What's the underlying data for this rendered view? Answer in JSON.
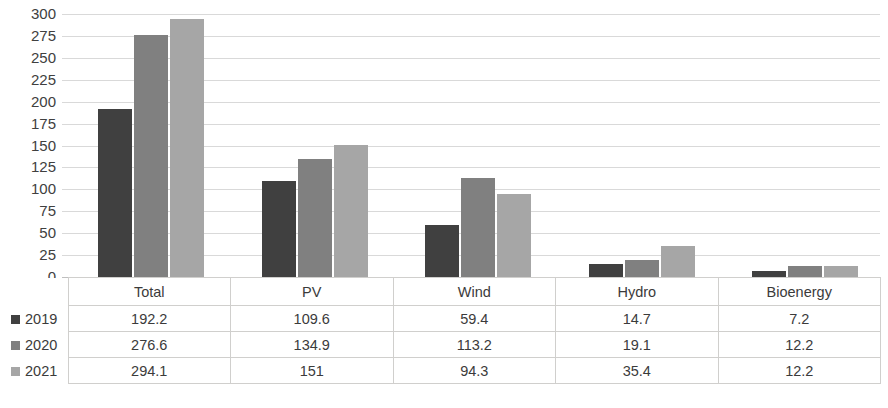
{
  "chart_data": {
    "type": "bar",
    "title": "",
    "xlabel": "",
    "ylabel": "",
    "ylim": [
      0,
      300
    ],
    "ytick_step": 25,
    "yticks": [
      300,
      275,
      250,
      225,
      200,
      175,
      150,
      125,
      100,
      75,
      50,
      25,
      0
    ],
    "grid": true,
    "legend_position": "table-left",
    "categories": [
      "Total",
      "PV",
      "Wind",
      "Hydro",
      "Bioenergy"
    ],
    "series": [
      {
        "name": "2019",
        "color": "#404040",
        "values": [
          192.2,
          109.6,
          59.4,
          14.7,
          7.2
        ]
      },
      {
        "name": "2020",
        "color": "#808080",
        "values": [
          276.6,
          134.9,
          113.2,
          19.1,
          12.2
        ]
      },
      {
        "name": "2021",
        "color": "#a6a6a6",
        "values": [
          294.1,
          151,
          94.3,
          35.4,
          12.2
        ]
      }
    ],
    "data_table": {
      "corner_label": "",
      "column_headers": [
        "Total",
        "PV",
        "Wind",
        "Hydro",
        "Bioenergy"
      ],
      "rows": [
        {
          "label": "2019",
          "swatch": "#404040",
          "cells": [
            "192.2",
            "109.6",
            "59.4",
            "14.7",
            "7.2"
          ]
        },
        {
          "label": "2020",
          "swatch": "#808080",
          "cells": [
            "276.6",
            "134.9",
            "113.2",
            "19.1",
            "12.2"
          ]
        },
        {
          "label": "2021",
          "swatch": "#a6a6a6",
          "cells": [
            "294.1",
            "151",
            "94.3",
            "35.4",
            "12.2"
          ]
        }
      ]
    },
    "colors": {
      "gridline": "#d9d9d9",
      "baseline": "#bfbfbf",
      "table_border": "#d0cfcd",
      "text": "#3b3b3b",
      "background": "#ffffff"
    }
  }
}
